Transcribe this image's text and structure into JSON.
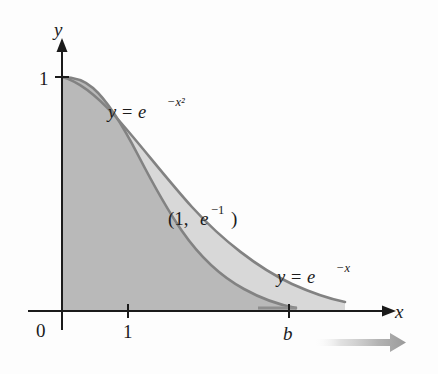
{
  "figure": {
    "kind": "math-graph",
    "background_color": "#fdfdfd",
    "axes": {
      "x_axis_label": "x",
      "y_axis_label": "y",
      "origin_label": "0",
      "x_ticks": [
        {
          "label": "1",
          "value": 1
        },
        {
          "label": "b",
          "value": 3.1
        }
      ],
      "y_ticks": [
        {
          "label": "1",
          "value": 1
        }
      ],
      "axis_color": "#1b1b1b",
      "x_range": [
        -0.35,
        4.6
      ],
      "y_range": [
        -0.28,
        1.38
      ]
    },
    "curves": [
      {
        "name": "gaussian-curve",
        "label": "y = e",
        "label_exponent": "−x²",
        "label_full": "y = e^(−x²)",
        "color": "#7d7d7d",
        "expression": "exp(-x*x)"
      },
      {
        "name": "exponential-curve",
        "label": "y = e",
        "label_exponent": "−x",
        "label_full": "y = e^(−x)",
        "color": "#7d7d7d",
        "expression": "exp(-x)"
      }
    ],
    "intersection_point": {
      "label_open": "(1, ",
      "label_base": "e",
      "label_exponent": "−1",
      "label_close": ")",
      "label_full": "(1, e⁻¹)",
      "x": 1,
      "y": 0.3679
    },
    "regions": [
      {
        "name": "region-under-gaussian",
        "description": "shaded area under y = e^(-x^2) from 0 to b",
        "fill": "#b8b8b8"
      },
      {
        "name": "region-between-curves",
        "description": "lighter shaded area between the two curves",
        "fill": "#d9d9d9"
      }
    ],
    "annotation_arrow": {
      "name": "b-to-infinity-arrow",
      "direction": "right",
      "color_start": "#ffffff",
      "color_end": "#9a9a9a"
    }
  }
}
